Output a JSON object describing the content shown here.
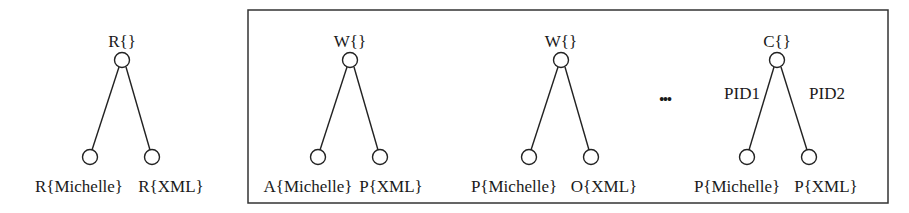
{
  "diagram": {
    "standalone_tree": {
      "root_label": "R{}",
      "left_child_label": "R{Michelle}",
      "right_child_label": "R{XML}"
    },
    "boxed_trees": [
      {
        "root_label": "W{}",
        "left_child_label": "A{Michelle}",
        "right_child_label": "P{XML}"
      },
      {
        "root_label": "W{}",
        "left_child_label": "P{Michelle}",
        "right_child_label": "O{XML}"
      },
      {
        "root_label": "C{}",
        "left_edge_label": "PID1",
        "right_edge_label": "PID2",
        "left_child_label": "P{Michelle}",
        "right_child_label": "P{XML}"
      }
    ],
    "ellipsis": "•••"
  }
}
